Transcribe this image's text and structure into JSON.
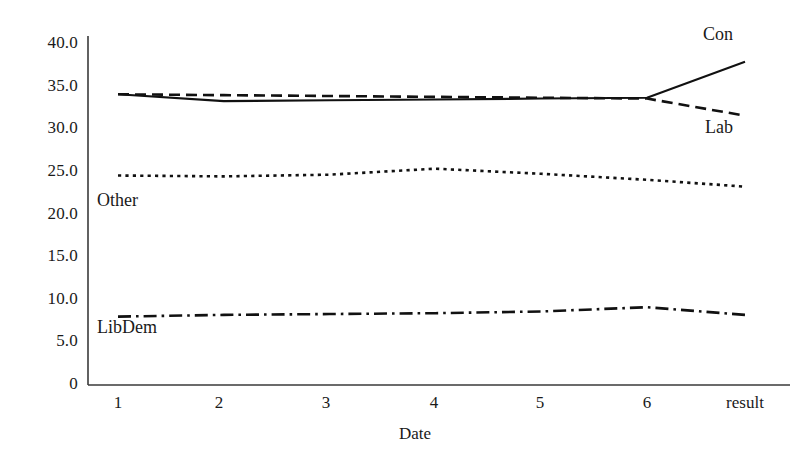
{
  "chart_data": {
    "type": "line",
    "title": "",
    "subtitle": "",
    "xlabel": "Date",
    "ylabel": "",
    "categories": [
      "1",
      "2",
      "3",
      "4",
      "5",
      "6",
      "result"
    ],
    "x_tick_labels": [
      "1",
      "2",
      "3",
      "4",
      "5",
      "6",
      "result"
    ],
    "y_tick_labels": [
      "40.0",
      "35.0",
      "30.0",
      "25.0",
      "20.0",
      "15.0",
      "10.0",
      "5.0",
      "0"
    ],
    "y_tick_values": [
      40,
      35,
      30,
      25,
      20,
      15,
      10,
      5,
      0
    ],
    "ylim": [
      0,
      41.5
    ],
    "xlim": [
      0,
      7.6
    ],
    "grid": false,
    "legend_position": "inline-annotations",
    "series": [
      {
        "name": "Con",
        "values": [
          34.0,
          33.2,
          33.3,
          33.4,
          33.5,
          33.6,
          37.8
        ],
        "line_style": "solid",
        "color": "#111111",
        "label_position": "right-top"
      },
      {
        "name": "Lab",
        "values": [
          34.0,
          33.9,
          33.8,
          33.7,
          33.6,
          33.5,
          31.5
        ],
        "line_style": "dashed",
        "color": "#111111",
        "label_position": "right-bottom"
      },
      {
        "name": "Other",
        "values": [
          24.5,
          24.4,
          24.6,
          25.3,
          24.7,
          24.0,
          23.2
        ],
        "line_style": "dotted",
        "color": "#111111",
        "label_position": "left-below"
      },
      {
        "name": "LibDem",
        "values": [
          8.0,
          8.2,
          8.3,
          8.4,
          8.6,
          9.1,
          8.2
        ],
        "line_style": "dashdot",
        "color": "#111111",
        "label_position": "left-below"
      }
    ],
    "annotations": [
      {
        "text": "Con",
        "series": "Con"
      },
      {
        "text": "Lab",
        "series": "Lab"
      },
      {
        "text": "Other",
        "series": "Other"
      },
      {
        "text": "LibDem",
        "series": "LibDem"
      }
    ]
  },
  "axes": {
    "y_labels": [
      "40.0",
      "35.0",
      "30.0",
      "25.0",
      "20.0",
      "15.0",
      "10.0",
      "5.0",
      "0"
    ],
    "x_labels": [
      "1",
      "2",
      "3",
      "4",
      "5",
      "6",
      "result"
    ],
    "x_axis_title": "Date"
  },
  "labels": {
    "con": "Con",
    "lab": "Lab",
    "other": "Other",
    "libdem": "LibDem"
  },
  "colors": {
    "line": "#111111",
    "axis": "#3a3a3a",
    "text": "#1a1a1a",
    "background": "#ffffff"
  }
}
